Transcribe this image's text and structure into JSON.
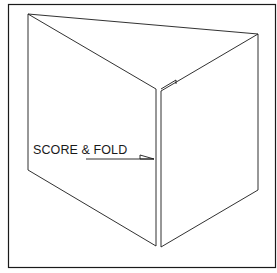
{
  "diagram": {
    "type": "line-drawing",
    "annotation": {
      "label": "SCORE & FOLD",
      "points_to": "fold line"
    },
    "colors": {
      "stroke": "#1a1a1a",
      "background": "#ffffff"
    }
  }
}
